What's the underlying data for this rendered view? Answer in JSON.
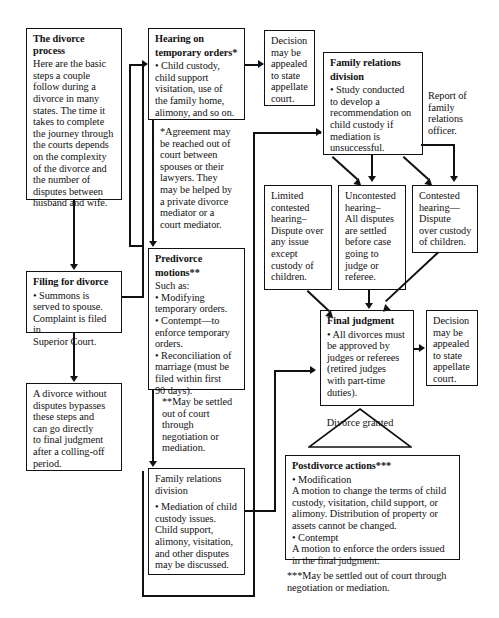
{
  "boxes": {
    "intro": {
      "heading": "The divorce process",
      "lines": [
        "Here are the basic",
        "steps a couple",
        "follow during a",
        "divorce in many",
        "states. The time it",
        "takes to complete",
        "the journey through",
        "the courts depends",
        "on the complexity",
        "of the divorce and",
        "the number of",
        "disputes between",
        "husband and wife."
      ]
    },
    "filing": {
      "heading": "Filing for divorce",
      "lines": [
        "• Summons is",
        "served to spouse.",
        "Complaint is filed in",
        "Superior Court."
      ]
    },
    "bypass": {
      "heading": "",
      "lines": [
        "A divorce without",
        "disputes bypasses",
        "these steps and",
        "can go directly",
        "to final judgment",
        "after a colling-off",
        "period."
      ]
    },
    "hearing_temp": {
      "heading": "Hearing on",
      "heading2": "temporary orders*",
      "lines": [
        "• Child custody,",
        "child support",
        "visitation, use of",
        "the family home,",
        "alimony, and so on."
      ]
    },
    "note_agreement": {
      "lines": [
        "*Agreement may",
        "be reached out of",
        "court between",
        "spouses or their",
        "lawyers. They",
        "may be helped by",
        "a private divorce",
        "mediator or a",
        "court mediator."
      ]
    },
    "predivorce": {
      "heading": "Predivorce",
      "heading2": "motions**",
      "lines": [
        "Such as:",
        "• Modifying",
        "temporary orders.",
        "• Contempt—to",
        "enforce temporary",
        "orders.",
        "• Reconciliation of",
        "marriage (must be",
        "filed within first",
        "90 days)."
      ]
    },
    "note_settled": {
      "lines": [
        "**May be settled",
        "out of court",
        "through",
        "negotiation or",
        "mediation."
      ]
    },
    "family_rel_lower": {
      "heading": "",
      "lines": [
        "Family relations",
        "division",
        "",
        "• Mediation of child",
        "custody issues.",
        "Child support,",
        "alimony, visitation,",
        "and other disputes",
        "may be discussed."
      ]
    },
    "decision_top": {
      "lines": [
        "Decision",
        "may be",
        "appealed",
        "to state",
        "appellate",
        "court."
      ]
    },
    "family_rel_upper": {
      "heading": "Family relations",
      "heading2": "division",
      "lines": [
        "• Study conducted",
        "to develop a",
        "recommendation on",
        "child custody if",
        "mediation is",
        "unsuccessful."
      ]
    },
    "report_note": {
      "lines": [
        "Report of",
        "family",
        "relations",
        "officer."
      ]
    },
    "limited_contested": {
      "lines": [
        "Limited",
        "contested",
        "hearing–",
        "Dispute over",
        "any issue",
        "except",
        "custody of",
        "children."
      ]
    },
    "uncontested": {
      "lines": [
        "Uncontested",
        "hearing–",
        "All disputes",
        "are settled",
        "before case",
        "going to",
        "judge or",
        "referee."
      ]
    },
    "contested": {
      "lines": [
        "Contested",
        "hearing—",
        "Dispute",
        "over custody",
        "of children."
      ]
    },
    "final_judgment": {
      "heading": "Final judgment",
      "lines": [
        "• All divorces must",
        "be approved by",
        "judges or referees",
        "(retired judges",
        "with part-time",
        "duties)."
      ]
    },
    "decision_bottom": {
      "lines": [
        "Decision",
        "may be",
        "appealed",
        "to state",
        "appellate",
        "court."
      ]
    },
    "divorce_granted": {
      "line1": "Divorce",
      "line2": "granted"
    },
    "postdivorce": {
      "heading": "Postdivorce actions***",
      "lines": [
        "• Modification",
        "A motion to change the terms of child",
        "custody, visitation, child support, or",
        "alimony. Distribution of property or",
        "assets cannot be changed.",
        "• Contempt",
        "A motion to enforce the orders issued",
        "in the final judgment."
      ]
    },
    "note_postdivorce": {
      "lines": [
        "***May be settled out of court through",
        "negotiation or mediation."
      ]
    }
  },
  "colors": {
    "ink": "#111111",
    "paper": "#ffffff"
  }
}
